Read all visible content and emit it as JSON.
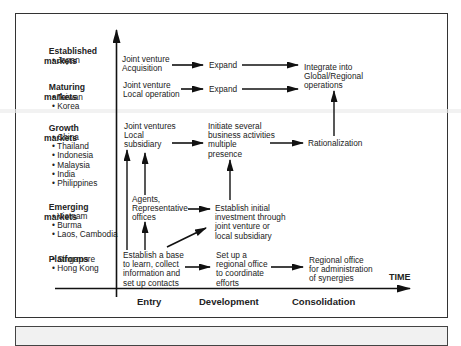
{
  "diagram": {
    "markets": [
      {
        "title_line1": "Established",
        "title_line2": "markets",
        "countries": [
          "Japan"
        ]
      },
      {
        "title_line1": "Maturing",
        "title_line2": "markets",
        "countries": [
          "Taiwan",
          "Korea"
        ]
      },
      {
        "title_line1": "Growth",
        "title_line2": "markets",
        "countries": [
          "China",
          "Thailand",
          "Indonesia",
          "Malaysia",
          "India",
          "Philippines"
        ]
      },
      {
        "title_line1": "Emerging",
        "title_line2": "markets",
        "countries": [
          "Vietnam",
          "Burma",
          "Laos, Cambodia"
        ]
      },
      {
        "title_line1": "Platforms",
        "title_line2": "",
        "countries": [
          "Singapore",
          "Hong Kong"
        ]
      }
    ],
    "nodes": {
      "jv_acquisition": "Joint venture\nAcquisition",
      "expand_1": "Expand",
      "jv_local_operation": "Joint venture\nLocal operation",
      "expand_2": "Expand",
      "integrate": "Integrate into\nGlobal/Regional\noperations",
      "jv_local_subsidiary": "Joint ventures\nLocal\nsubsidiary",
      "initiate_several": "Initiate several\nbusiness activities\nmultiple\npresence",
      "rationalization": "Rationalization",
      "agents": "Agents,\nRepresentative\noffices",
      "establish_initial": "Establish initial\ninvestment through\njoint venture or\nlocal subsidiary",
      "establish_base": "Establish a base\nto learn, collect\ninformation and\nset up contacts",
      "regional_office_setup": "Set up a\nregional office\nto coordinate\nefforts",
      "regional_office_admin": "Regional office\nfor administration\nof synergies"
    },
    "x_axis": {
      "label": "TIME",
      "phases": [
        "Entry",
        "Development",
        "Consolidation"
      ]
    },
    "colors": {
      "line": "#111111",
      "frame": "#333333",
      "text": "#222222"
    }
  }
}
